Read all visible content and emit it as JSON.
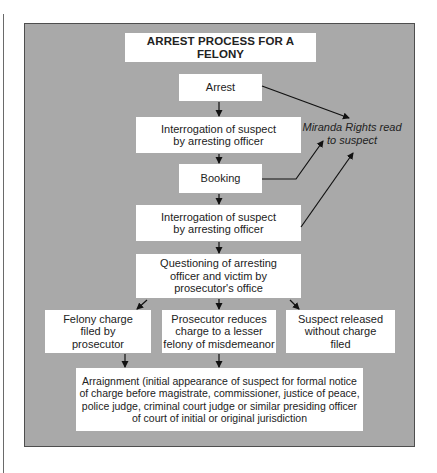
{
  "diagram": {
    "title": "ARREST PROCESS FOR A FELONY",
    "nodes": {
      "arrest": "Arrest",
      "interrogation_1": "Interrogation of suspect\nby arresting officer",
      "booking": "Booking",
      "interrogation_2": "Interrogation of suspect\nby arresting officer",
      "questioning": "Questioning of arresting\nofficer and victim by\nprosecutor's office",
      "felony_charge": "Felony charge\nfiled by\nprosecutor",
      "reduced_charge": "Prosecutor reduces\ncharge to a lesser\nfelony of misdemeanor",
      "released": "Suspect released\nwithout charge\nfiled",
      "arraignment": "Arraignment (initial appearance of suspect for formal notice\nof charge before magistrate, commissioner, justice of peace,\npolice judge, criminal court judge or similar presiding officer\nof court of initial or original jurisdiction"
    },
    "annotation": "Miranda Rights read\nto suspect",
    "edges": [
      {
        "from": "arrest",
        "to": "interrogation_1"
      },
      {
        "from": "interrogation_1",
        "to": "booking"
      },
      {
        "from": "booking",
        "to": "interrogation_2"
      },
      {
        "from": "interrogation_2",
        "to": "questioning"
      },
      {
        "from": "questioning",
        "to": "felony_charge"
      },
      {
        "from": "questioning",
        "to": "reduced_charge"
      },
      {
        "from": "questioning",
        "to": "released"
      },
      {
        "from": "felony_charge",
        "to": "arraignment"
      },
      {
        "from": "reduced_charge",
        "to": "arraignment"
      },
      {
        "from": "arrest",
        "to": "annotation"
      },
      {
        "from": "booking",
        "to": "annotation"
      },
      {
        "from": "interrogation_2",
        "to": "annotation"
      }
    ],
    "colors": {
      "panel": "#a9a9a9",
      "panel_border": "#4e4e4e",
      "box": "#ffffff",
      "arrow": "#111111"
    }
  }
}
